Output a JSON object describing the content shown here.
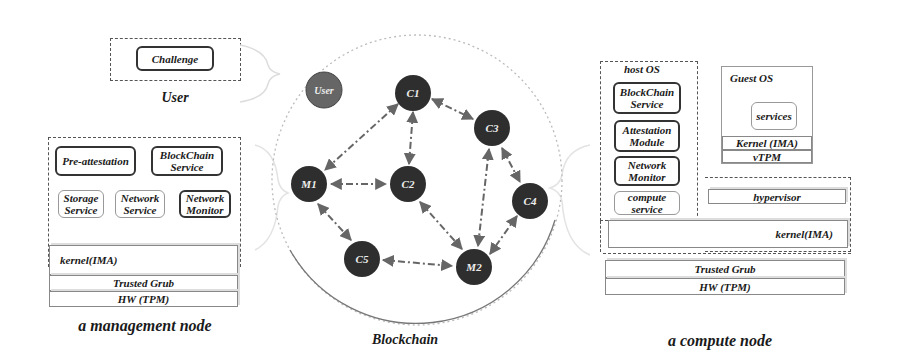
{
  "user_panel": {
    "challenge_label": "Challenge",
    "caption": "User"
  },
  "management_node": {
    "caption": "a management node",
    "services": [
      {
        "label": "Pre-attestation",
        "style": "bold"
      },
      {
        "label": "BlockChain Service",
        "style": "bold"
      },
      {
        "label": "Storage Service",
        "style": "light"
      },
      {
        "label": "Network Service",
        "style": "light"
      },
      {
        "label": "Network Monitor",
        "style": "bold"
      }
    ],
    "layers": {
      "kernel": "kernel(IMA)",
      "grub": "Trusted Grub",
      "hw": "HW (TPM)"
    }
  },
  "blockchain": {
    "caption": "Blockchain",
    "colors": {
      "node_fill": "#2e2e2e",
      "user_fill": "#666666",
      "edge": "#666666"
    },
    "nodes": [
      {
        "id": "User",
        "label": "User",
        "x": 324,
        "y": 90
      },
      {
        "id": "C1",
        "label": "C1",
        "x": 413,
        "y": 93
      },
      {
        "id": "C3",
        "label": "C3",
        "x": 492,
        "y": 128
      },
      {
        "id": "M1",
        "label": "M1",
        "x": 309,
        "y": 184
      },
      {
        "id": "C2",
        "label": "C2",
        "x": 408,
        "y": 184
      },
      {
        "id": "C4",
        "label": "C4",
        "x": 530,
        "y": 201
      },
      {
        "id": "C5",
        "label": "C5",
        "x": 362,
        "y": 259
      },
      {
        "id": "M2",
        "label": "M2",
        "x": 474,
        "y": 267
      }
    ],
    "edges": [
      [
        "C1",
        "M1"
      ],
      [
        "C1",
        "C2"
      ],
      [
        "C1",
        "C3"
      ],
      [
        "M1",
        "C2"
      ],
      [
        "M1",
        "C5"
      ],
      [
        "C3",
        "M2"
      ],
      [
        "C3",
        "C4"
      ],
      [
        "C2",
        "M2"
      ],
      [
        "C4",
        "M2"
      ],
      [
        "C5",
        "M2"
      ]
    ]
  },
  "compute_node": {
    "caption": "a compute node",
    "host_os": {
      "title": "host OS",
      "services": [
        {
          "label": "BlockChain Service",
          "style": "bold"
        },
        {
          "label": "Attestation Module",
          "style": "bold"
        },
        {
          "label": "Network Monitor",
          "style": "bold"
        },
        {
          "label": "compute service",
          "style": "light"
        }
      ]
    },
    "guest_os": {
      "title": "Guest OS",
      "services_label": "services",
      "kernel": "Kernel (IMA)",
      "vtpm": "vTPM"
    },
    "hypervisor": "hypervisor",
    "layers": {
      "kernel": "kernel(IMA)",
      "grub": "Trusted Grub",
      "hw": "HW (TPM)"
    }
  }
}
